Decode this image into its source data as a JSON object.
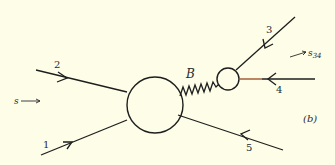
{
  "diagram": {
    "panel_label": "(b)",
    "background": "#fdfde8",
    "ink": "#1e1e1e",
    "accent_line_color": "#a0522d",
    "blob_large": {
      "cx": 155,
      "cy": 105,
      "r": 28
    },
    "blob_small": {
      "cx": 228,
      "cy": 79,
      "r": 11
    },
    "exchange": {
      "label": "B",
      "type": "wavy"
    },
    "legs": [
      {
        "label": "1",
        "direction": "incoming"
      },
      {
        "label": "2",
        "direction": "incoming"
      },
      {
        "label": "3",
        "direction": "incoming"
      },
      {
        "label": "4",
        "direction": "incoming"
      },
      {
        "label": "5",
        "direction": "outgoing-arrow-reversed"
      }
    ],
    "s_label": "s",
    "s34_label": "s",
    "s34_sub": "34"
  }
}
